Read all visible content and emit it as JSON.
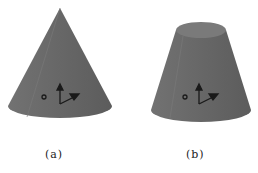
{
  "figures": [
    {
      "id": "a",
      "label": "(a)",
      "shape": "cone"
    },
    {
      "id": "b",
      "label": "(b)",
      "shape": "frustum"
    }
  ],
  "colors": {
    "solid_fill": "#6a6a6a",
    "solid_dark": "#585858",
    "top_face": "#7d7d7d",
    "axis": "#1a1a1a"
  }
}
